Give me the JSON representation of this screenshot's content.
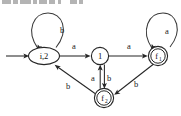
{
  "figure": {
    "kind": "finite-state-automaton",
    "width": 181,
    "height": 116,
    "background_color": "#ffffff",
    "stroke_color": "#262626",
    "label_color": "#111111"
  },
  "top_artifact": {
    "description": "clipped-text-row",
    "visible": true
  },
  "states": [
    {
      "id": "i2",
      "label": "i,2",
      "shape": "ellipse",
      "accepting": false,
      "initial": true,
      "x": 44,
      "y": 56,
      "rx": 15,
      "ry": 8.5
    },
    {
      "id": "q1",
      "label": "1",
      "shape": "circle",
      "accepting": false,
      "initial": false,
      "x": 100,
      "y": 56,
      "r": 8.5
    },
    {
      "id": "f1",
      "label": "f",
      "sublabel": "1",
      "shape": "double-circle",
      "accepting": true,
      "initial": false,
      "x": 158,
      "y": 56,
      "r": 9.5,
      "r_inner": 7.2
    },
    {
      "id": "f2",
      "label": "f",
      "sublabel": "2",
      "shape": "double-circle",
      "accepting": true,
      "initial": false,
      "x": 104,
      "y": 98,
      "r": 9.5,
      "r_inner": 7.2
    }
  ],
  "transitions": [
    {
      "id": "t-start",
      "from": "start",
      "to": "i2",
      "label": "",
      "kind": "initial-arrow"
    },
    {
      "id": "t-i2-i2",
      "from": "i2",
      "to": "i2",
      "label": "b",
      "kind": "self-loop",
      "label_x": 62,
      "label_y": 30
    },
    {
      "id": "t-i2-q1",
      "from": "i2",
      "to": "q1",
      "label": "a",
      "kind": "straight",
      "label_x": 74,
      "label_y": 46
    },
    {
      "id": "t-q1-f1",
      "from": "q1",
      "to": "f1",
      "label": "a",
      "kind": "straight",
      "label_x": 129,
      "label_y": 46
    },
    {
      "id": "t-f1-f1",
      "from": "f1",
      "to": "f1",
      "label": "a",
      "kind": "self-loop",
      "label_x": 167,
      "label_y": 31
    },
    {
      "id": "t-q1-f2",
      "from": "q1",
      "to": "f2",
      "label": "b",
      "kind": "vertical",
      "label_x": 109,
      "label_y": 78
    },
    {
      "id": "t-f2-q1",
      "from": "f2",
      "to": "q1",
      "label": "a",
      "kind": "vertical",
      "label_x": 93,
      "label_y": 78
    },
    {
      "id": "t-f1-f2",
      "from": "f1",
      "to": "f2",
      "label": "b",
      "kind": "diagonal",
      "label_x": 136,
      "label_y": 84
    },
    {
      "id": "t-f2-i2",
      "from": "f2",
      "to": "i2",
      "label": "b",
      "kind": "diagonal",
      "label_x": 68,
      "label_y": 86
    }
  ],
  "alphabet": [
    "a",
    "b"
  ],
  "initial_state": "i2",
  "accepting_states": [
    "f1",
    "f2"
  ]
}
